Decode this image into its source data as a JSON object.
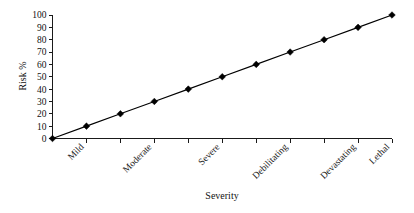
{
  "chart_data": {
    "type": "line",
    "title": "",
    "xlabel": "Severity",
    "ylabel": "Risk %",
    "categories": [
      "",
      "Mild",
      "",
      "Moderate",
      "",
      "Severe",
      "",
      "Debilitating",
      "",
      "Devastating",
      "Lethal"
    ],
    "visible_tick_labels": [
      "Mild",
      "Moderate",
      "Severe",
      "Debilitating",
      "Devastating",
      "Lethal"
    ],
    "x": [
      0,
      1,
      2,
      3,
      4,
      5,
      6,
      7,
      8,
      9,
      10
    ],
    "values": [
      0,
      10,
      20,
      30,
      40,
      50,
      60,
      70,
      80,
      90,
      100
    ],
    "series": [
      {
        "name": "Risk",
        "values": [
          0,
          10,
          20,
          30,
          40,
          50,
          60,
          70,
          80,
          90,
          100
        ]
      }
    ],
    "ylim": [
      0,
      100
    ],
    "ytick_labels": [
      "0",
      "10",
      "20",
      "30",
      "40",
      "50",
      "60",
      "70",
      "80",
      "90",
      "100"
    ],
    "ytick_values": [
      0,
      10,
      20,
      30,
      40,
      50,
      60,
      70,
      80,
      90,
      100
    ],
    "xlim": [
      0,
      10
    ],
    "grid": false,
    "legend": false,
    "legend_position": "none",
    "marker": "diamond",
    "line_color": "#000000",
    "marker_color": "#000000",
    "background_color": "#ffffff",
    "x_label_rotation": -45
  }
}
